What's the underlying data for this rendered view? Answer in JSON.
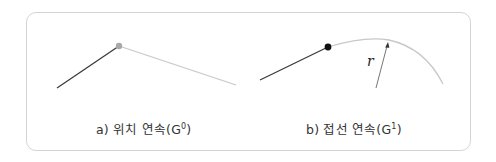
{
  "figure": {
    "panels": [
      {
        "id": "a",
        "caption_prefix": "a) 위치 연속(G",
        "caption_sup": "0",
        "caption_suffix": ")",
        "description": "Two line segments meeting at a shared point (positional continuity)",
        "point_color": "#a8a8a8",
        "line1_color": "#3a3a3a",
        "line2_color": "#c8c8c8"
      },
      {
        "id": "b",
        "caption_prefix": "b) 접선 연속(G",
        "caption_sup": "1",
        "caption_suffix": ")",
        "description": "Line segment joining an arc tangentially, with radius r marked",
        "radius_label": "r",
        "point_color": "#111111",
        "line_color": "#3a3a3a",
        "arc_color": "#c8c8c8"
      }
    ],
    "border_color": "#d4d4d4"
  }
}
